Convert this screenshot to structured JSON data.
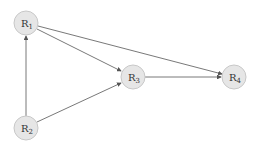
{
  "diagram": {
    "type": "directed-graph",
    "nodes": [
      {
        "id": "R1",
        "label": "R",
        "sub": "1",
        "cx": 26,
        "cy": 23
      },
      {
        "id": "R2",
        "label": "R",
        "sub": "2",
        "cx": 26,
        "cy": 128
      },
      {
        "id": "R3",
        "label": "R",
        "sub": "3",
        "cx": 133,
        "cy": 77
      },
      {
        "id": "R4",
        "label": "R",
        "sub": "4",
        "cx": 234,
        "cy": 77
      }
    ],
    "edges": [
      {
        "from": "R1",
        "to": "R3"
      },
      {
        "from": "R1",
        "to": "R4"
      },
      {
        "from": "R2",
        "to": "R1"
      },
      {
        "from": "R2",
        "to": "R3"
      },
      {
        "from": "R3",
        "to": "R4"
      }
    ],
    "colors": {
      "node_fill": "#e6e6e6",
      "node_stroke": "#c8c8c8",
      "edge": "#555555"
    }
  }
}
